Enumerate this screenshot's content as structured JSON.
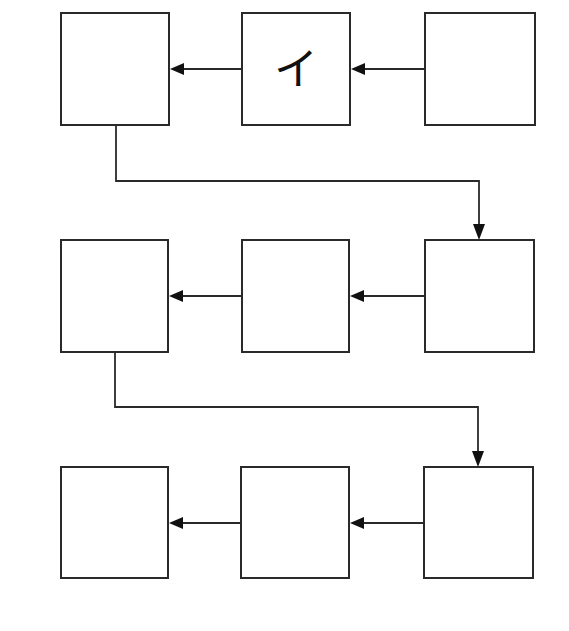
{
  "diagram": {
    "type": "flow-grid",
    "rows": 3,
    "columns": 3,
    "flow_direction": "right-to-left within row, then wrap from leftmost box down to rightmost box of next row",
    "boxes": [
      {
        "id": "r1c1",
        "row": 1,
        "col": 1,
        "label": ""
      },
      {
        "id": "r1c2",
        "row": 1,
        "col": 2,
        "label": "イ"
      },
      {
        "id": "r1c3",
        "row": 1,
        "col": 3,
        "label": ""
      },
      {
        "id": "r2c1",
        "row": 2,
        "col": 1,
        "label": ""
      },
      {
        "id": "r2c2",
        "row": 2,
        "col": 2,
        "label": ""
      },
      {
        "id": "r2c3",
        "row": 2,
        "col": 3,
        "label": ""
      },
      {
        "id": "r3c1",
        "row": 3,
        "col": 1,
        "label": ""
      },
      {
        "id": "r3c2",
        "row": 3,
        "col": 2,
        "label": ""
      },
      {
        "id": "r3c3",
        "row": 3,
        "col": 3,
        "label": ""
      }
    ],
    "arrows": [
      {
        "from": "r1c3",
        "to": "r1c2"
      },
      {
        "from": "r1c2",
        "to": "r1c1"
      },
      {
        "from": "r1c1",
        "to": "r2c3"
      },
      {
        "from": "r2c3",
        "to": "r2c2"
      },
      {
        "from": "r2c2",
        "to": "r2c1"
      },
      {
        "from": "r2c1",
        "to": "r3c3"
      },
      {
        "from": "r3c3",
        "to": "r3c2"
      },
      {
        "from": "r3c2",
        "to": "r3c1"
      }
    ]
  }
}
